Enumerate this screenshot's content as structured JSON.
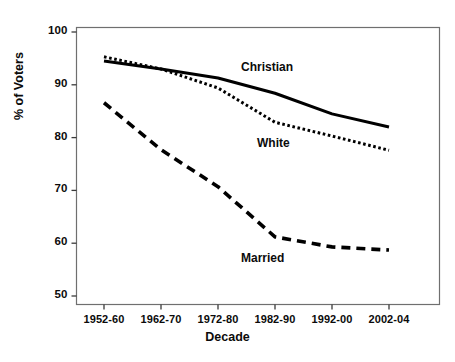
{
  "chart_data": {
    "type": "line",
    "title": "",
    "xlabel": "Decade",
    "ylabel": "% of Voters",
    "categories": [
      "1952-60",
      "1962-70",
      "1972-80",
      "1982-90",
      "1992-00",
      "2002-04"
    ],
    "ylim": [
      46,
      102
    ],
    "yticks": [
      50,
      60,
      70,
      80,
      90,
      100
    ],
    "ytick_labels": [
      "50",
      "60",
      "70",
      "80",
      "90",
      "100"
    ],
    "grid": false,
    "legend": "inline-labels",
    "series": [
      {
        "name": "Christian",
        "style": "solid",
        "color": "#000000",
        "values": [
          94.5,
          93.0,
          91.3,
          88.4,
          84.5,
          82.0
        ]
      },
      {
        "name": "White",
        "style": "dotted",
        "color": "#000000",
        "values": [
          95.3,
          93.0,
          89.4,
          82.9,
          80.3,
          77.6
        ]
      },
      {
        "name": "Married",
        "style": "dashed",
        "color": "#000000",
        "values": [
          86.6,
          77.7,
          70.7,
          61.2,
          59.3,
          58.7
        ]
      }
    ],
    "annotations": [
      {
        "text": "Christian",
        "series": "Christian"
      },
      {
        "text": "White",
        "series": "White"
      },
      {
        "text": "Married",
        "series": "Married"
      }
    ]
  }
}
